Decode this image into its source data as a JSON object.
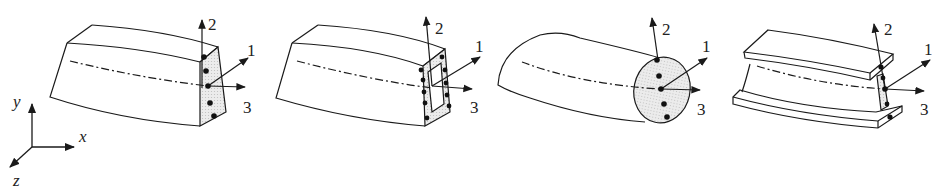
{
  "figure": {
    "truncated_caption": "",
    "global_axes": {
      "labels": [
        "y",
        "x",
        "z"
      ]
    },
    "panels": [
      {
        "id": "solid-rectangle",
        "section": "solid rectangular section",
        "axis_labels": [
          "1",
          "2",
          "3"
        ]
      },
      {
        "id": "hollow-box",
        "section": "thin-walled box section",
        "axis_labels": [
          "1",
          "2",
          "3"
        ]
      },
      {
        "id": "solid-circle",
        "section": "solid circular section",
        "axis_labels": [
          "1",
          "2",
          "3"
        ]
      },
      {
        "id": "i-beam",
        "section": "I-section",
        "axis_labels": [
          "1",
          "2",
          "3"
        ]
      }
    ],
    "colors": {
      "line": "#1a1a1a",
      "section_fill": "#e4e4e4",
      "background": "#ffffff"
    }
  }
}
